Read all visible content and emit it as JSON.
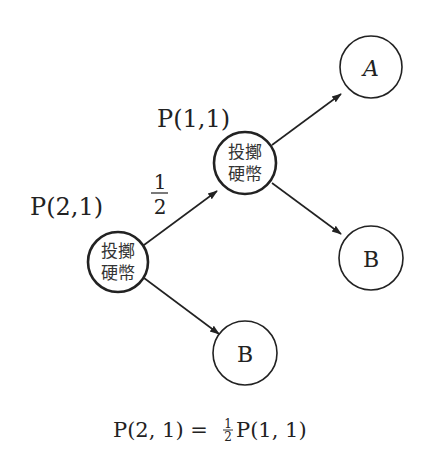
{
  "diagram": {
    "type": "probability-tree",
    "colors": {
      "stroke": "#222222",
      "text": "#222222",
      "background": "#ffffff"
    },
    "nodes": [
      {
        "id": "coin1",
        "label_line1": "投擲",
        "label_line2": "硬幣",
        "kind": "decision",
        "cx": 118,
        "cy": 262,
        "r": 30
      },
      {
        "id": "coin2",
        "label_line1": "投擲",
        "label_line2": "硬幣",
        "kind": "decision",
        "cx": 245,
        "cy": 163,
        "r": 31
      },
      {
        "id": "outcomeA",
        "label": "A",
        "kind": "outcome",
        "cx": 371,
        "cy": 67,
        "r": 31
      },
      {
        "id": "outcomeB_top",
        "label": "B",
        "kind": "outcome",
        "cx": 371,
        "cy": 258,
        "r": 32
      },
      {
        "id": "outcomeB_bottom",
        "label": "B",
        "kind": "outcome",
        "cx": 245,
        "cy": 353,
        "r": 32
      }
    ],
    "edges": [
      {
        "from": "coin1",
        "to": "coin2",
        "label": "1/2"
      },
      {
        "from": "coin1",
        "to": "outcomeB_bottom"
      },
      {
        "from": "coin2",
        "to": "outcomeA"
      },
      {
        "from": "coin2",
        "to": "outcomeB_top"
      }
    ],
    "state_labels": {
      "p21": "P(2,1)",
      "p11": "P(1,1)"
    },
    "edge_fraction": {
      "numerator": "1",
      "denominator": "2"
    },
    "equation": {
      "lhs": "P(2, 1) =",
      "frac_num": "1",
      "frac_den": "2",
      "rhs": "P(1, 1)"
    }
  }
}
